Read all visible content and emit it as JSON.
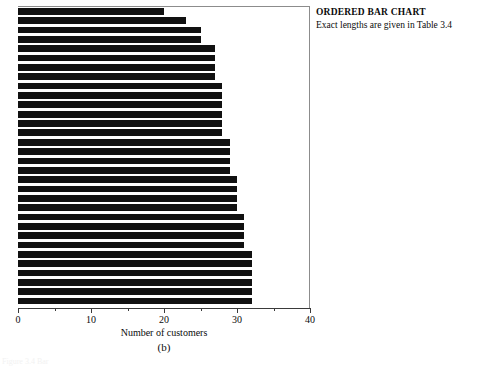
{
  "annotation": {
    "title": "ORDERED BAR CHART",
    "subtitle": "Exact lengths are given in Table 3.4"
  },
  "panel": {
    "caption": "(b)",
    "figure_caption": "Figure 3.4  Bar"
  },
  "chart_data": {
    "type": "bar",
    "orientation": "horizontal",
    "title": "",
    "xlabel": "Number of customers",
    "ylabel": "",
    "xlim": [
      0,
      40
    ],
    "xticks": [
      0,
      10,
      20,
      30,
      40
    ],
    "xtick_labels": [
      "0",
      "10",
      "20",
      "30",
      "40"
    ],
    "minor_ticks": [
      5,
      15,
      25,
      35
    ],
    "grid": false,
    "legend": "none",
    "bar_color": "#111111",
    "categories": [
      "b1",
      "b2",
      "b3",
      "b4",
      "b5",
      "b6",
      "b7",
      "b8",
      "b9",
      "b10",
      "b11",
      "b12",
      "b13",
      "b14",
      "b15",
      "b16",
      "b17",
      "b18",
      "b19",
      "b20",
      "b21",
      "b22",
      "b23",
      "b24",
      "b25",
      "b26",
      "b27",
      "b28",
      "b29",
      "b30",
      "b31",
      "b32"
    ],
    "values": [
      20,
      23,
      25,
      25,
      27,
      27,
      27,
      27,
      28,
      28,
      28,
      28,
      28,
      28,
      29,
      29,
      29,
      29,
      30,
      30,
      30,
      30,
      31,
      31,
      31,
      31,
      32,
      32,
      32,
      32,
      32,
      32
    ]
  }
}
